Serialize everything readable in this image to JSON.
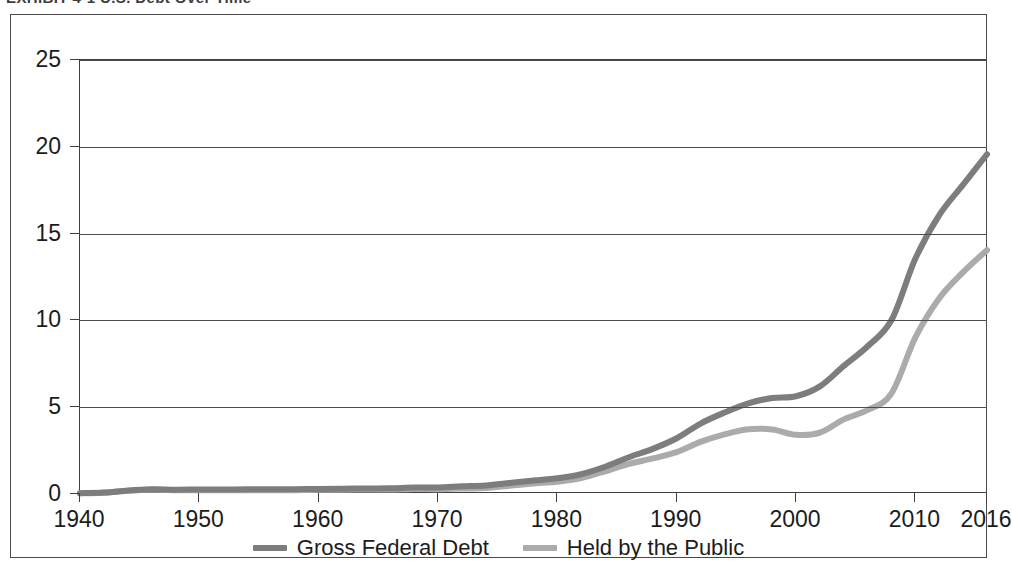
{
  "header": {
    "title_clipped": "EXHIBIT 4-1  U.S. Debt Over Time",
    "title_right_clipped": ""
  },
  "legend": {
    "position": "bottom-center",
    "items": [
      {
        "label": "Gross Federal Debt",
        "color": "#7d7d7d",
        "key": "gross_federal_debt"
      },
      {
        "label": "Held by the Public",
        "color": "#ababab",
        "key": "held_by_the_public"
      }
    ]
  },
  "chart_data": {
    "type": "line",
    "title": "EXHIBIT 4-1  U.S. Debt Over Time",
    "xlabel": "",
    "ylabel": "",
    "xlim": [
      1940,
      2016
    ],
    "ylim": [
      0,
      25
    ],
    "grid": true,
    "y_ticks": [
      0,
      5,
      10,
      15,
      20,
      25
    ],
    "y_tick_labels": [
      "0",
      "5",
      "10",
      "15",
      "20",
      "25"
    ],
    "x_ticks": [
      1940,
      1950,
      1960,
      1970,
      1980,
      1990,
      2000,
      2010,
      2016
    ],
    "x_tick_labels": [
      "1940",
      "1950",
      "1960",
      "1970",
      "1980",
      "1990",
      "2000",
      "2010",
      "2016"
    ],
    "legend_position": "bottom-center",
    "x": [
      1940,
      1942,
      1944,
      1946,
      1948,
      1950,
      1952,
      1954,
      1956,
      1958,
      1960,
      1962,
      1964,
      1966,
      1968,
      1970,
      1972,
      1974,
      1976,
      1978,
      1980,
      1982,
      1984,
      1986,
      1988,
      1990,
      1992,
      1994,
      1996,
      1998,
      2000,
      2002,
      2004,
      2006,
      2008,
      2010,
      2012,
      2014,
      2016
    ],
    "series": [
      {
        "name": "Gross Federal Debt",
        "color": "#7d7d7d",
        "values": [
          0.05,
          0.08,
          0.2,
          0.27,
          0.25,
          0.26,
          0.26,
          0.27,
          0.27,
          0.28,
          0.29,
          0.3,
          0.32,
          0.33,
          0.37,
          0.38,
          0.44,
          0.49,
          0.63,
          0.78,
          0.91,
          1.14,
          1.57,
          2.12,
          2.6,
          3.21,
          4.06,
          4.69,
          5.22,
          5.53,
          5.63,
          6.2,
          7.38,
          8.51,
          10.02,
          13.56,
          16.07,
          17.82,
          19.57
        ],
        "units": "trillions of dollars"
      },
      {
        "name": "Held by the Public",
        "color": "#ababab",
        "values": [
          0.04,
          0.07,
          0.18,
          0.24,
          0.22,
          0.22,
          0.21,
          0.22,
          0.22,
          0.22,
          0.24,
          0.25,
          0.26,
          0.26,
          0.29,
          0.28,
          0.32,
          0.34,
          0.48,
          0.61,
          0.71,
          0.92,
          1.31,
          1.74,
          2.05,
          2.41,
          3.0,
          3.43,
          3.73,
          3.72,
          3.41,
          3.54,
          4.3,
          4.84,
          5.8,
          9.02,
          11.28,
          12.78,
          14.05
        ],
        "units": "trillions of dollars"
      }
    ]
  }
}
